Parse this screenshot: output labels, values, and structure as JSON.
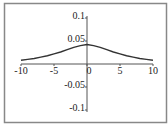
{
  "chart_data": {
    "type": "line",
    "title": "",
    "xlabel": "",
    "ylabel": "",
    "xlim": [
      -10,
      10
    ],
    "ylim": [
      -0.1,
      0.1
    ],
    "grid": false,
    "legend": "none",
    "x_ticks": [
      {
        "value": -10,
        "label": "-10"
      },
      {
        "value": -5,
        "label": "-5"
      },
      {
        "value": 0,
        "label": "0"
      },
      {
        "value": 5,
        "label": "5"
      },
      {
        "value": 10,
        "label": "10"
      }
    ],
    "y_ticks": [
      {
        "value": 0.1,
        "label": "0.1"
      },
      {
        "value": 0.05,
        "label": "0.05"
      },
      {
        "value": -0.05,
        "label": "-0.05"
      },
      {
        "value": -0.1,
        "label": "-0.1"
      }
    ],
    "series": [
      {
        "name": "f(x)",
        "color": "#333333",
        "x": [
          -10,
          -9,
          -8,
          -7,
          -6,
          -5,
          -4,
          -3,
          -2,
          -1,
          0,
          1,
          2,
          3,
          4,
          5,
          6,
          7,
          8,
          9,
          10
        ],
        "values": [
          0.008,
          0.01,
          0.012,
          0.015,
          0.018,
          0.022,
          0.026,
          0.031,
          0.036,
          0.04,
          0.0425,
          0.04,
          0.036,
          0.031,
          0.026,
          0.022,
          0.018,
          0.015,
          0.012,
          0.01,
          0.008
        ]
      }
    ]
  },
  "colors": {
    "frame": "#888888",
    "axis": "#555555",
    "curve": "#333333",
    "text": "#222222"
  }
}
